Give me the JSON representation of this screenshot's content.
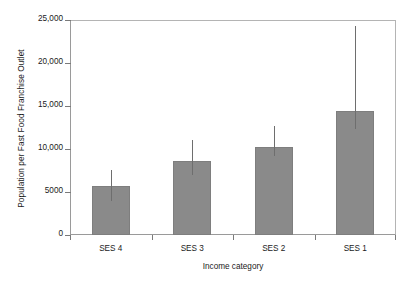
{
  "chart_data": {
    "type": "bar",
    "title": "",
    "xlabel": "Income category",
    "ylabel": "Population per Fast Food Franchise Outlet",
    "categories": [
      "SES 4",
      "SES 3",
      "SES 2",
      "SES 1"
    ],
    "values": [
      5700,
      8650,
      10250,
      14450
    ],
    "error_low": [
      3950,
      7000,
      9150,
      12300
    ],
    "error_high": [
      7550,
      11050,
      12700,
      24300
    ],
    "ylim": [
      0,
      25000
    ],
    "ytick_values": [
      0,
      5000,
      10000,
      15000,
      20000,
      25000
    ],
    "ytick_labels": [
      "0",
      "5000",
      "10,000",
      "15,000",
      "20,000",
      "25,000"
    ],
    "grid": false,
    "legend": null,
    "bar_color": "#8a8a8a",
    "error_color": "#6e6e6e",
    "axis_color": "#7a7a7a",
    "frame": true
  }
}
